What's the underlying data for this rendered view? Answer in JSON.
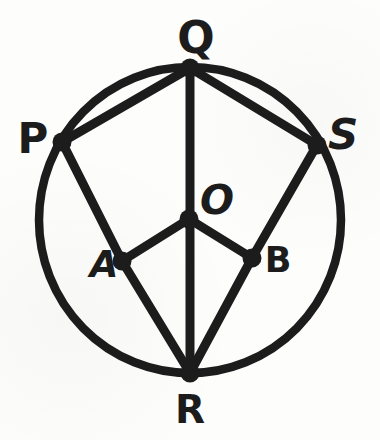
{
  "figure": {
    "background": "#fdfdfc",
    "ink": "#1c1c1c",
    "stroke_width": 9,
    "dot_radius": 9.5,
    "circle": {
      "cx": 190,
      "cy": 220,
      "rx": 151,
      "ry": 153,
      "stroke_width": 8.5
    },
    "points": {
      "Q": {
        "x": 190,
        "y": 68
      },
      "P": {
        "x": 62,
        "y": 142
      },
      "S": {
        "x": 317,
        "y": 145
      },
      "R": {
        "x": 190,
        "y": 373
      },
      "O": {
        "x": 189,
        "y": 219
      },
      "A": {
        "x": 122,
        "y": 261
      },
      "B": {
        "x": 252,
        "y": 258
      }
    },
    "segments": [
      {
        "from": "P",
        "to": "Q"
      },
      {
        "from": "Q",
        "to": "S"
      },
      {
        "from": "Q",
        "to": "R"
      },
      {
        "from": "P",
        "to": "A"
      },
      {
        "from": "A",
        "to": "R"
      },
      {
        "from": "S",
        "to": "B"
      },
      {
        "from": "B",
        "to": "R"
      },
      {
        "from": "O",
        "to": "A"
      },
      {
        "from": "O",
        "to": "B"
      }
    ],
    "labels": [
      {
        "for": "Q",
        "text": "Q",
        "x": 196,
        "y": 53,
        "size": 44,
        "italic": false
      },
      {
        "for": "P",
        "text": "P",
        "x": 33,
        "y": 153,
        "size": 42,
        "italic": false
      },
      {
        "for": "S",
        "text": "S",
        "x": 343,
        "y": 149,
        "size": 42,
        "italic": true
      },
      {
        "for": "O",
        "text": "O",
        "x": 217,
        "y": 214,
        "size": 40,
        "italic": true
      },
      {
        "for": "A",
        "text": "A",
        "x": 104,
        "y": 277,
        "size": 37,
        "italic": true
      },
      {
        "for": "B",
        "text": "B",
        "x": 278,
        "y": 272,
        "size": 35,
        "italic": false
      },
      {
        "for": "R",
        "text": "R",
        "x": 190,
        "y": 423,
        "size": 39,
        "italic": false
      }
    ]
  }
}
